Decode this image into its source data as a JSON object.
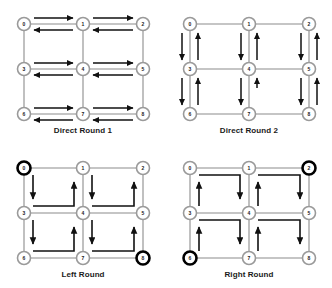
{
  "figure": {
    "panels": [
      {
        "id": "direct-round-1",
        "caption": "Direct Round 1",
        "position": "top-left",
        "flow": "horizontal",
        "description": "Bidirectional horizontal arrow pairs on every row edge",
        "highlighted_nodes": []
      },
      {
        "id": "direct-round-2",
        "caption": "Direct Round 2",
        "position": "top-right",
        "flow": "vertical",
        "description": "Bidirectional vertical arrow pairs on every column edge",
        "highlighted_nodes": []
      },
      {
        "id": "left-round",
        "caption": "Left Round",
        "position": "bottom-left",
        "flow": "counterclockwise",
        "description": "Counterclockwise loop inside each of the four cells",
        "highlighted_nodes": [
          0,
          8
        ]
      },
      {
        "id": "right-round",
        "caption": "Right Round",
        "position": "bottom-right",
        "flow": "clockwise",
        "description": "Clockwise loop inside each of the four cells",
        "highlighted_nodes": [
          2,
          6
        ]
      }
    ],
    "graph": {
      "rows": 3,
      "cols": 3,
      "node_labels": [
        "0",
        "1",
        "2",
        "3",
        "4",
        "5",
        "6",
        "7",
        "8"
      ],
      "node_positions": [
        {
          "label": "0",
          "col": 0,
          "row": 0
        },
        {
          "label": "1",
          "col": 1,
          "row": 0
        },
        {
          "label": "2",
          "col": 2,
          "row": 0
        },
        {
          "label": "3",
          "col": 0,
          "row": 1
        },
        {
          "label": "4",
          "col": 1,
          "row": 1
        },
        {
          "label": "5",
          "col": 2,
          "row": 1
        },
        {
          "label": "6",
          "col": 0,
          "row": 2
        },
        {
          "label": "7",
          "col": 1,
          "row": 2
        },
        {
          "label": "8",
          "col": 2,
          "row": 2
        }
      ]
    },
    "colors": {
      "background": "#ffffff",
      "node_fill": "#ffffff",
      "node_stroke": "#9a9a9a",
      "node_stroke_highlight": "#000000",
      "grid_edge": "#8c8c8c",
      "arrow": "#111111",
      "caption_text": "#1a1a1a"
    },
    "node_labels_text": {
      "n0": "0",
      "n1": "1",
      "n2": "2",
      "n3": "3",
      "n4": "4",
      "n5": "5",
      "n6": "6",
      "n7": "7",
      "n8": "8"
    }
  }
}
